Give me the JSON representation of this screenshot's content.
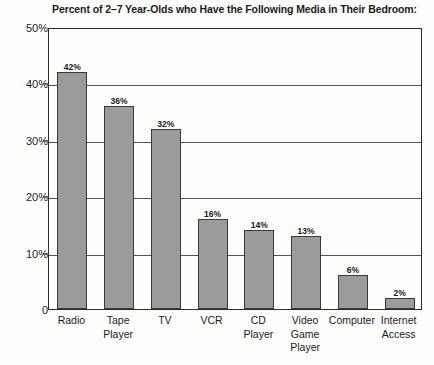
{
  "chart_data": {
    "type": "bar",
    "title": "Percent of 2–7 Year-Olds who Have the Following Media in Their Bedroom:",
    "xlabel": "",
    "ylabel": "",
    "ylim": [
      0,
      50
    ],
    "grid": true,
    "legend": false,
    "categories": [
      "Radio",
      "Tape Player",
      "TV",
      "VCR",
      "CD Player",
      "Video Game Player",
      "Computer",
      "Internet Access"
    ],
    "category_lines": [
      [
        "Radio"
      ],
      [
        "Tape",
        "Player"
      ],
      [
        "TV"
      ],
      [
        "VCR"
      ],
      [
        "CD",
        "Player"
      ],
      [
        "Video",
        "Game",
        "Player"
      ],
      [
        "Computer"
      ],
      [
        "Internet",
        "Access"
      ]
    ],
    "values": [
      42,
      36,
      32,
      16,
      14,
      13,
      6,
      2
    ],
    "value_labels": [
      "42%",
      "36%",
      "32%",
      "16%",
      "14%",
      "13%",
      "6%",
      "2%"
    ],
    "y_ticks": [
      0,
      10,
      20,
      30,
      40,
      50
    ],
    "y_tick_labels": [
      "0",
      "10%",
      "20%",
      "30%",
      "40%",
      "50%"
    ],
    "colors": {
      "bar_fill": "#9b9b9b",
      "bar_stroke": "#3a3a3a",
      "axis": "#2b2b2b",
      "grid": "#555555",
      "text": "#1b1b1b",
      "background": "#fdfdfb"
    }
  }
}
